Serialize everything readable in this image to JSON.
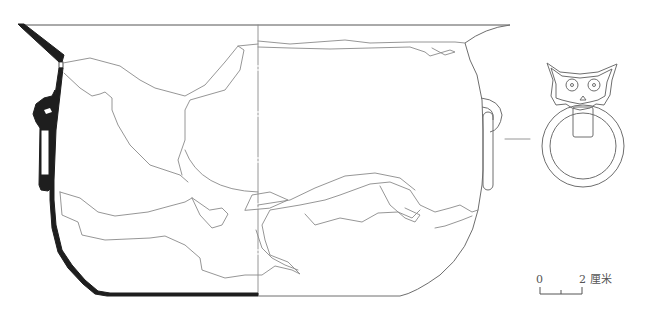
{
  "figure": {
    "views": [
      "cross-section (left half)",
      "exterior elevation (right half)",
      "handle detail (owl-face mask with ring)"
    ]
  },
  "scale_bar": {
    "start_label": "0",
    "end_label": "2",
    "unit_label": "厘米",
    "ticks": 3
  },
  "colors": {
    "section_fill": "#1e1e1e",
    "line": "#8a8a8a",
    "background": "#ffffff"
  }
}
